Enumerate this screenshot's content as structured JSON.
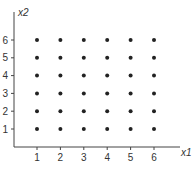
{
  "chart_data": {
    "type": "scatter",
    "title": "",
    "xlabel": "x1",
    "ylabel": "x2",
    "xlim": [
      0,
      7.5
    ],
    "ylim": [
      0,
      6.9
    ],
    "xticks": [
      "1",
      "2",
      "3",
      "4",
      "5",
      "6"
    ],
    "yticks": [
      "1",
      "2",
      "3",
      "4",
      "5",
      "6"
    ],
    "grid": false,
    "points": [
      [
        1,
        1
      ],
      [
        2,
        1
      ],
      [
        3,
        1
      ],
      [
        4,
        1
      ],
      [
        5,
        1
      ],
      [
        6,
        1
      ],
      [
        1,
        2
      ],
      [
        2,
        2
      ],
      [
        3,
        2
      ],
      [
        4,
        2
      ],
      [
        5,
        2
      ],
      [
        6,
        2
      ],
      [
        1,
        3
      ],
      [
        2,
        3
      ],
      [
        3,
        3
      ],
      [
        4,
        3
      ],
      [
        5,
        3
      ],
      [
        6,
        3
      ],
      [
        1,
        4
      ],
      [
        2,
        4
      ],
      [
        3,
        4
      ],
      [
        4,
        4
      ],
      [
        5,
        4
      ],
      [
        6,
        4
      ],
      [
        1,
        5
      ],
      [
        2,
        5
      ],
      [
        3,
        5
      ],
      [
        4,
        5
      ],
      [
        5,
        5
      ],
      [
        6,
        5
      ],
      [
        1,
        6
      ],
      [
        2,
        6
      ],
      [
        3,
        6
      ],
      [
        4,
        6
      ],
      [
        5,
        6
      ],
      [
        6,
        6
      ]
    ],
    "point_color": "#222222",
    "axis_color": "#444444"
  }
}
